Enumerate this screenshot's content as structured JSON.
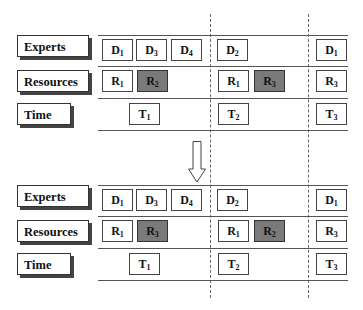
{
  "diagram": {
    "row_labels": {
      "experts": "Experts",
      "resources": "Resources",
      "time": "Time"
    },
    "colors": {
      "highlight": "#7a7a7a",
      "line": "#555555"
    },
    "panels": [
      {
        "name": "before",
        "experts": [
          {
            "letter": "D",
            "sub": "1"
          },
          {
            "letter": "D",
            "sub": "3"
          },
          {
            "letter": "D",
            "sub": "4"
          },
          {
            "letter": "D",
            "sub": "2"
          },
          {
            "letter": "D",
            "sub": "1"
          }
        ],
        "resources": [
          {
            "letter": "R",
            "sub": "1",
            "highlight": false
          },
          {
            "letter": "R",
            "sub": "2",
            "highlight": true
          },
          {
            "letter": "R",
            "sub": "1",
            "highlight": false
          },
          {
            "letter": "R",
            "sub": "3",
            "highlight": true
          },
          {
            "letter": "R",
            "sub": "3",
            "highlight": false
          }
        ],
        "time": [
          {
            "letter": "T",
            "sub": "1"
          },
          {
            "letter": "T",
            "sub": "2"
          },
          {
            "letter": "T",
            "sub": "3"
          }
        ]
      },
      {
        "name": "after",
        "experts": [
          {
            "letter": "D",
            "sub": "1"
          },
          {
            "letter": "D",
            "sub": "3"
          },
          {
            "letter": "D",
            "sub": "4"
          },
          {
            "letter": "D",
            "sub": "2"
          },
          {
            "letter": "D",
            "sub": "1"
          }
        ],
        "resources": [
          {
            "letter": "R",
            "sub": "1",
            "highlight": false
          },
          {
            "letter": "R",
            "sub": "3",
            "highlight": true
          },
          {
            "letter": "R",
            "sub": "1",
            "highlight": false
          },
          {
            "letter": "R",
            "sub": "2",
            "highlight": true
          },
          {
            "letter": "R",
            "sub": "3",
            "highlight": false
          }
        ],
        "time": [
          {
            "letter": "T",
            "sub": "1"
          },
          {
            "letter": "T",
            "sub": "2"
          },
          {
            "letter": "T",
            "sub": "3"
          }
        ]
      }
    ],
    "transition_arrow": "down-arrow"
  }
}
